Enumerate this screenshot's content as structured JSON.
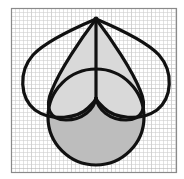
{
  "diagram": {
    "title": "",
    "background": "#ffffff",
    "grid": {
      "x": 11,
      "y": 8,
      "width": 165,
      "height": 164,
      "minor_spacing": 4,
      "minor_color": "#cfcfcf",
      "major_every": 5,
      "major_color": "#b5b5b5",
      "border_color": "#8a8a8a"
    },
    "stroke_color": "#111111",
    "stroke_width": 3.2,
    "apex": {
      "x": 96,
      "y": 19
    },
    "circle": {
      "cx": 96,
      "cy": 117,
      "r": 48,
      "fill": "#bdbdbd"
    },
    "inner_lobe_fill": "#d9d9d9",
    "outer_lobe_fill": "none",
    "shapes": [
      {
        "name": "outer-left-lobe",
        "fill": "none"
      },
      {
        "name": "outer-right-lobe",
        "fill": "none"
      },
      {
        "name": "inner-left-lobe",
        "fill": "#d9d9d9"
      },
      {
        "name": "inner-right-lobe",
        "fill": "#d9d9d9"
      },
      {
        "name": "bottom-circle",
        "fill": "#bdbdbd"
      }
    ]
  }
}
